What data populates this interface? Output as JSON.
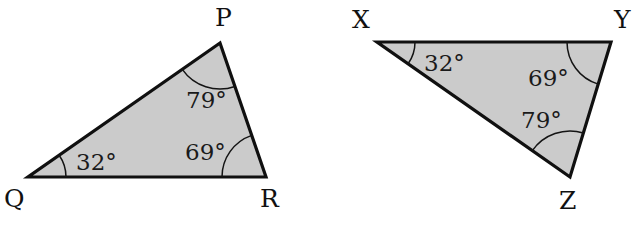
{
  "figure": {
    "background_color": "#ffffff",
    "fill_color": "#cbcbcb",
    "stroke_color": "#101010",
    "degree_symbol": "°"
  },
  "triangles": [
    {
      "name": "triangle-pqr",
      "vertices": [
        {
          "label": "P",
          "x": 220,
          "y": 43,
          "label_x": 215,
          "label_y": 26
        },
        {
          "label": "Q",
          "x": 28,
          "y": 177,
          "label_x": 4,
          "label_y": 207
        },
        {
          "label": "R",
          "x": 266,
          "y": 177,
          "label_x": 260,
          "label_y": 207
        }
      ],
      "angles": [
        {
          "at": "P",
          "value": "79",
          "text": "79°",
          "text_x": 186,
          "text_y": 108,
          "arc_radius": 46
        },
        {
          "at": "Q",
          "value": "32",
          "text": "32°",
          "text_x": 76,
          "text_y": 170,
          "arc_radius": 38
        },
        {
          "at": "R",
          "value": "69",
          "text": "69°",
          "text_x": 185,
          "text_y": 160,
          "arc_radius": 44
        }
      ]
    },
    {
      "name": "triangle-xyz",
      "vertices": [
        {
          "label": "X",
          "x": 377,
          "y": 42,
          "label_x": 352,
          "label_y": 28
        },
        {
          "label": "Y",
          "x": 611,
          "y": 42,
          "label_x": 614,
          "label_y": 28
        },
        {
          "label": "Z",
          "x": 570,
          "y": 177,
          "label_x": 559,
          "label_y": 209
        }
      ],
      "angles": [
        {
          "at": "X",
          "value": "32",
          "text": "32°",
          "text_x": 424,
          "text_y": 71,
          "arc_radius": 38
        },
        {
          "at": "Y",
          "value": "69",
          "text": "69°",
          "text_x": 528,
          "text_y": 86,
          "arc_radius": 44
        },
        {
          "at": "Z",
          "value": "79",
          "text": "79°",
          "text_x": 521,
          "text_y": 128,
          "arc_radius": 46
        }
      ]
    }
  ]
}
